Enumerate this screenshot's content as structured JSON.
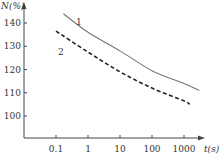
{
  "chart_data": {
    "type": "line",
    "title": "",
    "xlabel": "t(s)",
    "ylabel": "N(%)",
    "x_scale": "log",
    "x_ticks": [
      0.1,
      1,
      10,
      100,
      1000
    ],
    "x_tick_labels": [
      "0.1",
      "1",
      "10",
      "100",
      "1000"
    ],
    "y_ticks": [
      100,
      110,
      120,
      130,
      140
    ],
    "y_tick_labels": [
      "100",
      "110",
      "120",
      "130",
      "140"
    ],
    "ylim": [
      93,
      146
    ],
    "xlim": [
      0.01,
      10000
    ],
    "grid": false,
    "legend": "inline labels",
    "series": [
      {
        "name": "1",
        "style": "solid",
        "color": "#777777",
        "x": [
          0.17,
          1,
          10,
          100,
          1000,
          3000
        ],
        "values": [
          144,
          136,
          128,
          119.5,
          114,
          111
        ]
      },
      {
        "name": "2",
        "style": "dashed",
        "color": "#222222",
        "x": [
          0.1,
          1,
          10,
          100,
          1000,
          1500
        ],
        "values": [
          136.5,
          127.5,
          119,
          112,
          106.5,
          105
        ]
      }
    ]
  }
}
